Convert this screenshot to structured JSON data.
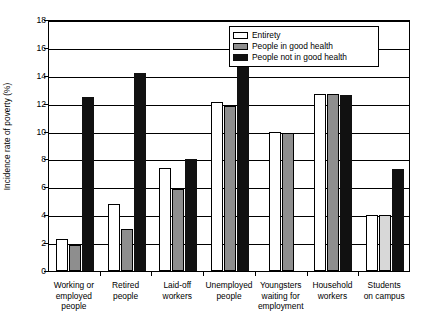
{
  "chart_data": {
    "type": "bar",
    "title": "",
    "xlabel": "",
    "ylabel": "Incidence rate of poverty (%)",
    "ylim": [
      0,
      18
    ],
    "ytick_step": 2,
    "yticks": [
      "18",
      "16",
      "14",
      "12",
      "10",
      "8",
      "6",
      "4",
      "2",
      "0"
    ],
    "grid": true,
    "legend_position": "top-right",
    "categories": [
      "Working or employed people",
      "Retired people",
      "Laid-off workers",
      "Unemployed people",
      "Youngsters waiting for employment",
      "Household workers",
      "Students on campus"
    ],
    "category_lines": [
      [
        "Working or",
        "employed",
        "people"
      ],
      [
        "Retired",
        "people"
      ],
      [
        "Laid-off",
        "workers"
      ],
      [
        "Unemployed",
        "people"
      ],
      [
        "Youngsters",
        "waiting for",
        "employment"
      ],
      [
        "Household",
        "workers"
      ],
      [
        "Students",
        "on campus"
      ]
    ],
    "series": [
      {
        "name": "Entirety",
        "key": "entirety",
        "color": "#ffffff",
        "values": [
          2.3,
          4.8,
          7.4,
          12.1,
          10.0,
          12.7,
          4.0
        ]
      },
      {
        "name": "People in good health",
        "key": "good",
        "color": "#8e8e8e",
        "values": [
          1.9,
          3.0,
          5.9,
          11.8,
          9.9,
          12.7,
          4.0
        ]
      },
      {
        "name": "People not in good health",
        "key": "notgood",
        "color": "#111111",
        "values": [
          12.5,
          14.2,
          8.0,
          16.5,
          null,
          12.6,
          7.3
        ]
      }
    ]
  },
  "legend": {
    "items": [
      {
        "label": "Entirety",
        "key": "entirety"
      },
      {
        "label": "People in good health",
        "key": "good"
      },
      {
        "label": "People not in good health",
        "key": "notgood"
      }
    ]
  }
}
